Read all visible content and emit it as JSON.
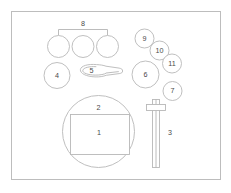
{
  "figure": {
    "background_color": "#ffffff",
    "stroke_color": "#b8b8b8",
    "frame_color": "#bdbdbd",
    "label_color": "#4a4a4a",
    "frame": {
      "x": 11,
      "y": 11,
      "width": 210,
      "height": 169
    },
    "labels": {
      "one": "1",
      "two": "2",
      "three": "3",
      "four": "4",
      "five": "5",
      "six": "6",
      "seven": "7",
      "eight": "8",
      "nine": "9",
      "ten": "10",
      "eleven": "11"
    },
    "parts": [
      {
        "id": "1",
        "name": "rectangular-panel",
        "label": "1",
        "shape": "rectangle"
      },
      {
        "id": "2",
        "name": "large-disc",
        "label": "2",
        "shape": "circle"
      },
      {
        "id": "3",
        "name": "vertical-rod",
        "label": "3",
        "shape": "rod-with-collar"
      },
      {
        "id": "4",
        "name": "medium-disc-left",
        "label": "4",
        "shape": "circle"
      },
      {
        "id": "5",
        "name": "spoon-ladle",
        "label": "5",
        "shape": "spoon"
      },
      {
        "id": "6",
        "name": "medium-disc-right",
        "label": "6",
        "shape": "circle"
      },
      {
        "id": "7",
        "name": "small-disc-lower",
        "label": "7",
        "shape": "circle"
      },
      {
        "id": "8",
        "name": "bracket-group-of-three",
        "label": "8",
        "shape": "bracket"
      },
      {
        "id": "9",
        "name": "small-disc-upper",
        "label": "9",
        "shape": "circle"
      },
      {
        "id": "10",
        "name": "small-disc-middle",
        "label": "10",
        "shape": "circle"
      },
      {
        "id": "11",
        "name": "small-disc-lower-middle",
        "label": "11",
        "shape": "circle"
      }
    ]
  }
}
